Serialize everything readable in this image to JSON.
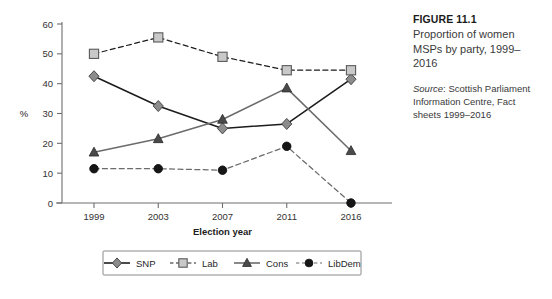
{
  "caption": {
    "figure_word": "FIGURE",
    "figure_number": "11.1",
    "title": "Proportion of women MSPs by party, 1999–2016",
    "source_word": "Source",
    "source_text": ": Scottish Parliament Information Centre, Fact sheets 1999–2016"
  },
  "chart_data": {
    "type": "line",
    "title": "Proportion of women MSPs by party, 1999–2016",
    "xlabel": "Election year",
    "ylabel": "%",
    "categories": [
      "1999",
      "2003",
      "2007",
      "2011",
      "2016"
    ],
    "ylim": [
      0,
      60
    ],
    "yticks": [
      0,
      10,
      20,
      30,
      40,
      50,
      60
    ],
    "grid": false,
    "legend_position": "bottom",
    "series": [
      {
        "name": "SNP",
        "values": [
          42.5,
          32.5,
          25.0,
          26.5,
          41.5
        ],
        "marker": "diamond",
        "line_style": "solid",
        "color": "#8c8c8c",
        "line_color": "#1c1c1c"
      },
      {
        "name": "Lab",
        "values": [
          50.0,
          55.5,
          49.0,
          44.5,
          44.5
        ],
        "marker": "square",
        "line_style": "dashed",
        "color": "#c9c9c9",
        "line_color": "#1c1c1c"
      },
      {
        "name": "Cons",
        "values": [
          17.0,
          21.5,
          28.0,
          38.5,
          17.5
        ],
        "marker": "triangle",
        "line_style": "solid",
        "color": "#4a4a4a",
        "line_color": "#6b6b6b"
      },
      {
        "name": "LibDem",
        "values": [
          11.5,
          11.5,
          11.0,
          19.0,
          0.0
        ],
        "marker": "circle",
        "line_style": "dashed",
        "color": "#161616",
        "line_color": "#6b6b6b"
      }
    ]
  }
}
